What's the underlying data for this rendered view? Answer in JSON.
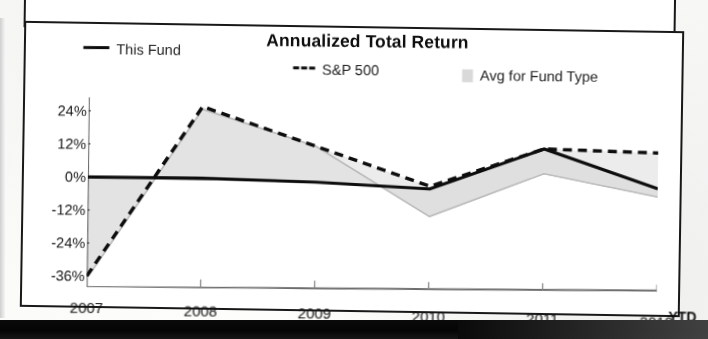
{
  "document": {
    "bottom_band_present": true
  },
  "chart": {
    "title": "Annualized Total Return",
    "legend": [
      {
        "label": "This Fund",
        "marker": "solid-line-key",
        "color": "#111111"
      },
      {
        "label": "S&P 500",
        "marker": "dashed-line-key",
        "color": "#111111"
      },
      {
        "label": "Avg for Fund Type",
        "marker": "gray-swatch-key",
        "color": "#cfcfcf"
      }
    ],
    "x_axis": {
      "ticks": [
        "2007",
        "2008",
        "2009",
        "2010",
        "2011",
        "2012"
      ],
      "suffix": "YTD"
    },
    "y_axis": {
      "ticks": [
        "24%",
        "12%",
        "0%",
        "-12%",
        "-24%",
        "-36%"
      ]
    }
  },
  "chart_data": {
    "type": "line",
    "title": "Annualized Total Return",
    "xlabel": "",
    "ylabel": "",
    "categories": [
      "2007",
      "2008",
      "2009",
      "2010",
      "2011",
      "2012 YTD"
    ],
    "x": [
      2007,
      2008,
      2009,
      2010,
      2011,
      2012
    ],
    "ylim": [
      -40,
      29
    ],
    "yticks": [
      24,
      12,
      0,
      -12,
      -24,
      -36
    ],
    "ytick_labels": [
      "24%",
      "12%",
      "0%",
      "-12%",
      "-24%",
      "-36%"
    ],
    "grid": false,
    "legend_position": "top",
    "series": [
      {
        "name": "This Fund",
        "style": "solid",
        "color": "#111111",
        "values": [
          0,
          0,
          -1,
          -3,
          12,
          -2
        ]
      },
      {
        "name": "S&P 500",
        "style": "dashed",
        "color": "#111111",
        "values": [
          -36,
          26,
          12,
          -2,
          12,
          11
        ]
      },
      {
        "name": "Avg for Fund Type",
        "style": "filled-band",
        "color": "#cfcfcf",
        "values": [
          -37,
          25,
          12,
          -13,
          3,
          -5
        ]
      }
    ],
    "annotations": [
      "YTD"
    ]
  }
}
